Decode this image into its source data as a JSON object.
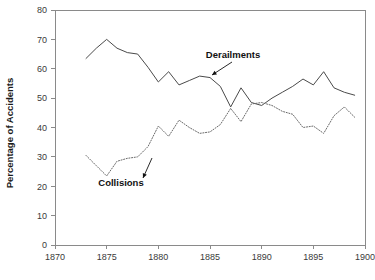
{
  "chart_data": {
    "type": "line",
    "title": "",
    "subtitle": "",
    "xlabel": "",
    "ylabel": "Percentage of Accidents",
    "xlim": [
      1870,
      1900
    ],
    "ylim": [
      0,
      80
    ],
    "xticks": [
      1870,
      1875,
      1880,
      1885,
      1890,
      1895,
      1900
    ],
    "yticks": [
      0,
      10,
      20,
      30,
      40,
      50,
      60,
      70,
      80
    ],
    "grid": false,
    "legend_position": "inline-annotations",
    "x": [
      1873,
      1874,
      1875,
      1876,
      1877,
      1878,
      1879,
      1880,
      1881,
      1882,
      1883,
      1884,
      1885,
      1886,
      1887,
      1888,
      1889,
      1890,
      1891,
      1892,
      1893,
      1894,
      1895,
      1896,
      1897,
      1898,
      1899
    ],
    "series": [
      {
        "name": "Derailments",
        "style": "solid",
        "color": "#4a4a4a",
        "values": [
          63.5,
          67.0,
          70.0,
          67.0,
          65.5,
          65.0,
          60.5,
          55.5,
          59.0,
          54.5,
          56.0,
          57.5,
          57.0,
          54.0,
          47.0,
          53.5,
          48.5,
          47.5,
          50.0,
          52.0,
          54.0,
          56.5,
          54.5,
          59.0,
          53.5,
          52.0,
          51.0
        ]
      },
      {
        "name": "Collisions",
        "style": "dotted",
        "color": "#6a6a6a",
        "values": [
          30.5,
          27.0,
          23.5,
          28.5,
          29.5,
          30.0,
          33.5,
          40.5,
          37.0,
          42.5,
          40.0,
          38.0,
          38.5,
          41.0,
          46.5,
          42.0,
          48.0,
          48.5,
          47.5,
          45.5,
          44.5,
          40.0,
          40.5,
          38.0,
          44.0,
          47.0,
          43.5
        ]
      }
    ],
    "annotations": [
      {
        "text": "Derailments",
        "label_x": 233,
        "label_y": 58,
        "arrow_from_x": 232,
        "arrow_from_y": 62,
        "arrow_to_x": 212,
        "arrow_to_y": 75
      },
      {
        "text": "Collisions",
        "label_x": 121,
        "label_y": 186,
        "arrow_from_x": 152,
        "arrow_from_y": 158,
        "arrow_to_x": 143,
        "arrow_to_y": 178
      }
    ]
  }
}
